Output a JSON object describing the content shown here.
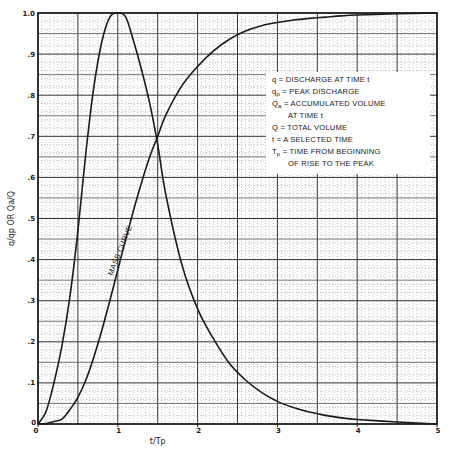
{
  "chart_data": {
    "type": "line",
    "title": "",
    "xlabel": "t/Tp",
    "ylabel": "q/qp OR Qa/Q",
    "xlim": [
      0,
      5
    ],
    "ylim": [
      0,
      1.0
    ],
    "grid": true,
    "x_ticks": [
      {
        "value": 0,
        "label": "0"
      },
      {
        "value": 1,
        "label": "1"
      },
      {
        "value": 2,
        "label": "2"
      },
      {
        "value": 3,
        "label": "3"
      },
      {
        "value": 4,
        "label": "4"
      },
      {
        "value": 5,
        "label": "5"
      }
    ],
    "y_ticks": [
      {
        "value": 0,
        "label": "0"
      },
      {
        "value": 0.1,
        "label": ".1"
      },
      {
        "value": 0.2,
        "label": ".2"
      },
      {
        "value": 0.3,
        "label": ".3"
      },
      {
        "value": 0.4,
        "label": ".4"
      },
      {
        "value": 0.5,
        "label": ".5"
      },
      {
        "value": 0.6,
        "label": ".6"
      },
      {
        "value": 0.7,
        "label": ".7"
      },
      {
        "value": 0.8,
        "label": ".8"
      },
      {
        "value": 0.9,
        "label": ".9"
      },
      {
        "value": 1.0,
        "label": "1.0"
      }
    ],
    "series": [
      {
        "name": "Dimensionless unit hydrograph (q/qp)",
        "x": [
          0,
          0.1,
          0.2,
          0.3,
          0.4,
          0.5,
          0.6,
          0.7,
          0.8,
          0.9,
          1.0,
          1.1,
          1.2,
          1.3,
          1.4,
          1.5,
          1.6,
          1.8,
          2.0,
          2.2,
          2.4,
          2.6,
          2.8,
          3.0,
          3.2,
          3.4,
          3.6,
          3.8,
          4.0,
          4.5,
          5.0
        ],
        "values": [
          0,
          0.03,
          0.1,
          0.19,
          0.31,
          0.47,
          0.66,
          0.82,
          0.93,
          0.99,
          1.0,
          0.99,
          0.93,
          0.86,
          0.78,
          0.68,
          0.56,
          0.39,
          0.28,
          0.207,
          0.147,
          0.107,
          0.077,
          0.055,
          0.04,
          0.029,
          0.021,
          0.015,
          0.011,
          0.005,
          0.0
        ]
      },
      {
        "name": "Mass curve (Qa/Q)",
        "label": "MASS CURVE",
        "x": [
          0,
          0.1,
          0.2,
          0.3,
          0.4,
          0.5,
          0.6,
          0.7,
          0.8,
          0.9,
          1.0,
          1.1,
          1.2,
          1.3,
          1.4,
          1.5,
          1.6,
          1.8,
          2.0,
          2.2,
          2.4,
          2.6,
          2.8,
          3.0,
          3.2,
          3.4,
          3.6,
          3.8,
          4.0,
          4.5,
          5.0
        ],
        "values": [
          0,
          0.001,
          0.006,
          0.012,
          0.035,
          0.065,
          0.107,
          0.163,
          0.228,
          0.3,
          0.375,
          0.45,
          0.522,
          0.589,
          0.65,
          0.7,
          0.751,
          0.822,
          0.87,
          0.908,
          0.936,
          0.956,
          0.969,
          0.977,
          0.983,
          0.987,
          0.99,
          0.993,
          0.995,
          0.998,
          1.0
        ]
      }
    ],
    "legend": {
      "placement": "center-right",
      "entries": [
        {
          "symbol": "q",
          "sub": "",
          "text": "= DISCHARGE AT TIME t"
        },
        {
          "symbol": "q",
          "sub": "p",
          "text": "= PEAK DISCHARGE"
        },
        {
          "symbol": "Q",
          "sub": "a",
          "text": "= ACCUMULATED VOLUME"
        },
        {
          "symbol": "",
          "sub": "",
          "text": "AT TIME t"
        },
        {
          "symbol": "Q",
          "sub": "",
          "text": "= TOTAL VOLUME"
        },
        {
          "symbol": "t",
          "sub": "",
          "text": "= A SELECTED TIME"
        },
        {
          "symbol": "T",
          "sub": "p",
          "text": "= TIME FROM BEGINNING"
        },
        {
          "symbol": "",
          "sub": "",
          "text": "OF RISE TO THE PEAK"
        }
      ]
    }
  }
}
